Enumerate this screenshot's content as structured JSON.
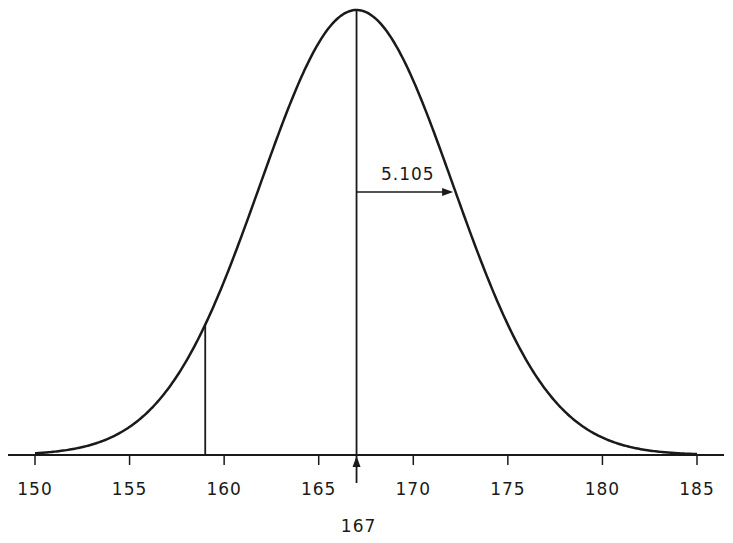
{
  "chart_data": {
    "type": "line",
    "title": "",
    "xlabel": "",
    "ylabel": "",
    "distribution": "normal",
    "mean": 167,
    "std_dev": 5.105,
    "mean_label": "167",
    "std_dev_label": "5.105",
    "shaded_left_bound": 159,
    "xlim": [
      150,
      185
    ],
    "x_ticks": [
      150,
      155,
      160,
      165,
      170,
      175,
      180,
      185
    ],
    "x_tick_labels": [
      "150",
      "155",
      "160",
      "165",
      "170",
      "175",
      "180",
      "185"
    ],
    "grid": false,
    "legend": null,
    "annotations": [
      {
        "type": "vertical-line",
        "x": 167,
        "label": "167",
        "note": "mean, arrow pointing up from below axis"
      },
      {
        "type": "horizontal-arrow",
        "from_x": 167,
        "to_x": 172.105,
        "label": "5.105",
        "note": "standard deviation"
      },
      {
        "type": "vertical-line",
        "x": 159,
        "note": "boundary line from axis to curve"
      }
    ]
  },
  "colors": {
    "curve": "#1a1a1a",
    "background": "#ffffff"
  }
}
